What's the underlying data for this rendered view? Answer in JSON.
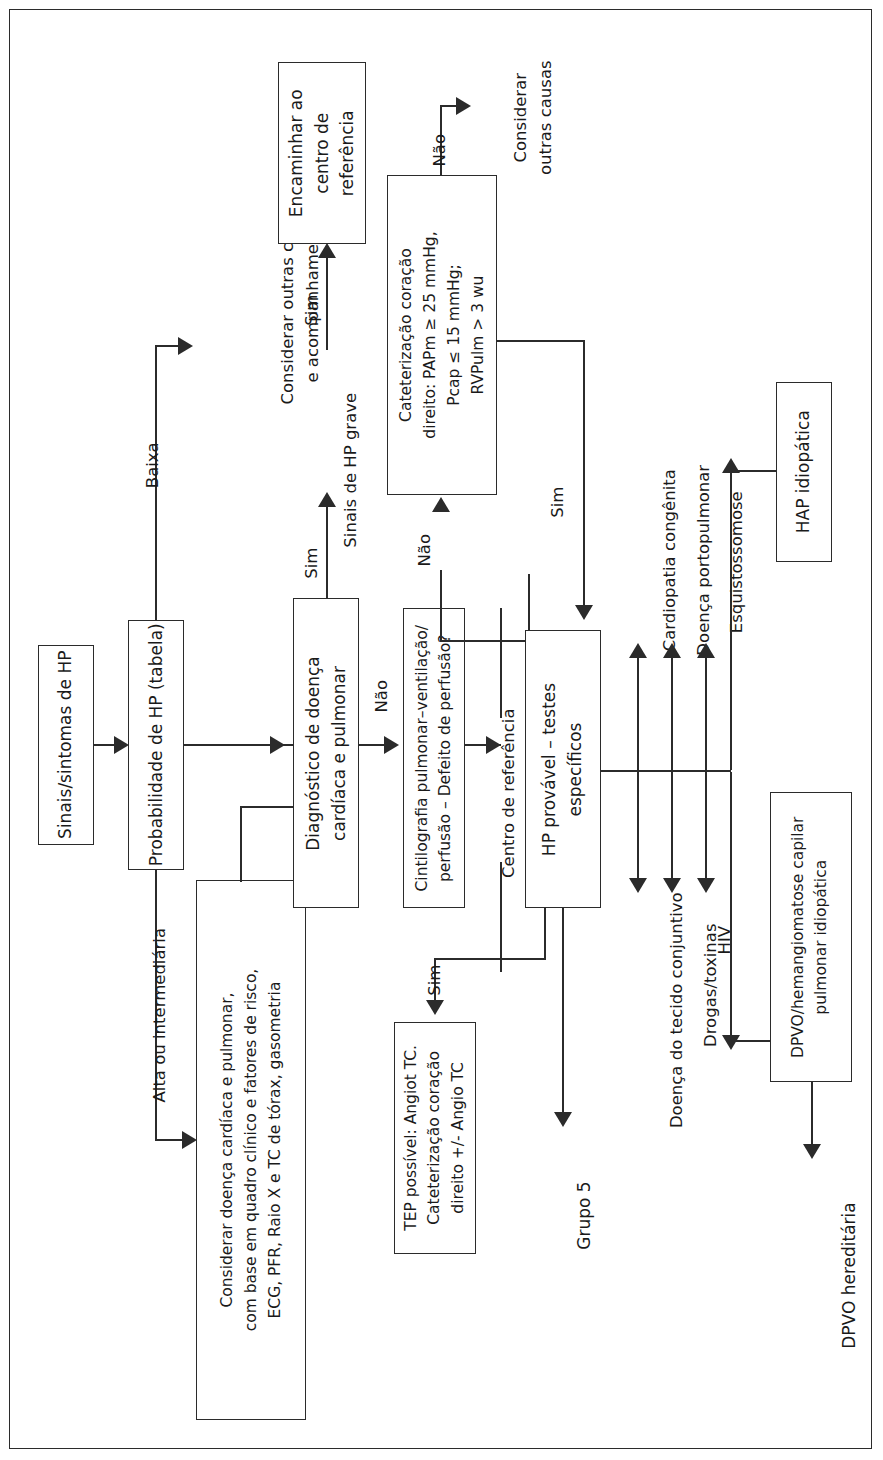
{
  "diagram": {
    "orientation": "rotated-90-ccw",
    "frame_color": "#2b2b2b",
    "nodes": {
      "signs": "Sinais/sintomas de HP",
      "probability": "Probabilidade de HP (tabela)",
      "consider_cardiac": "Considerar doença cardíaca e pulmonar,\ncom base em quadro clínico e fatores de risco,\nECG, PFR, Raio X e TC de tórax, gasometria",
      "diagnosis_cardiac": "Diagnóstico de doença\ncardíaca e pulmonar",
      "scintigraphy": "Cintilografia pulmonar–ventilação/\nperfusão – Defeito de perfusão?",
      "refer_center": "Encaminhar ao\ncentro de\nreferência",
      "catheter": "Cateterização coração\ndireito: PAPm ≥ 25 mmHg,\nPcap ≤ 15 mmHg;\nRVPulm > 3 wu",
      "tep": "TEP possível: Angiot TC.\nCateterização coração\ndireito +/- Angio TC",
      "hp_probable": "HP provável – testes\nespecíficos",
      "hap_idiopathic": "HAP idiopática",
      "dpvo_capilar": "DPVO/hemangiomatose capilar\npulmonar idiopática"
    },
    "free_labels": {
      "consider_other_follow": "Considerar outras causas\ne acompanhamento",
      "consider_other": "Considerar\noutras causas",
      "signs_severe": "Sinais de HP grave",
      "reference_center": "Centro de referência",
      "group5": "Grupo 5",
      "dpvo_hereditary": "DPVO hereditária"
    },
    "edge_labels": {
      "low": "Baixa",
      "high_or_intermediate": "Alta ou intermediária",
      "yes_severe": "Sim",
      "yes_refer": "Sim",
      "no_scinti": "Não",
      "yes_tep": "Sim",
      "no_catheter": "Não",
      "no_other_causes": "Não",
      "yes_hp_probable": "Sim"
    },
    "specific_tests_upper": [
      "Cardiopatia congênita",
      "Doença portopulmonar",
      "Esquistossomose"
    ],
    "specific_tests_lower": [
      "Doença do tecido conjuntivo",
      "Drogas/toxinas",
      "HIV"
    ]
  }
}
